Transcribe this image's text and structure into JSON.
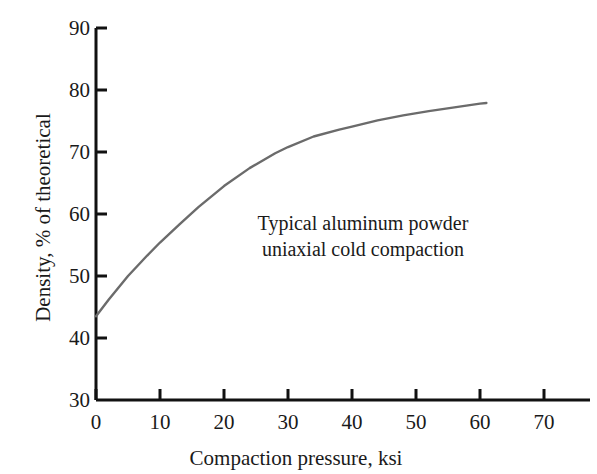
{
  "chart_data": {
    "type": "line",
    "title": "",
    "xlabel": "Compaction pressure, ksi",
    "ylabel": "Density, % of theoretical",
    "xlim": [
      0,
      74
    ],
    "ylim": [
      30,
      90
    ],
    "xticks": [
      0,
      10,
      20,
      30,
      40,
      50,
      60,
      70
    ],
    "yticks": [
      30,
      40,
      50,
      60,
      70,
      80,
      90
    ],
    "xtick_labels": [
      "0",
      "10",
      "20",
      "30",
      "40",
      "50",
      "60",
      "70"
    ],
    "ytick_labels": [
      "30",
      "40",
      "50",
      "60",
      "70",
      "80",
      "90"
    ],
    "grid": false,
    "legend": false,
    "series": [
      {
        "name": "Typical aluminum powder uniaxial cold compaction",
        "color": "#6b6b6b",
        "x": [
          0,
          2,
          5,
          8,
          10,
          13,
          16,
          20,
          24,
          28,
          30,
          34,
          38,
          40,
          44,
          48,
          52,
          56,
          60,
          61
        ],
        "y": [
          43.5,
          46.2,
          50.0,
          53.3,
          55.4,
          58.3,
          61.1,
          64.5,
          67.4,
          69.8,
          70.8,
          72.5,
          73.6,
          74.1,
          75.1,
          75.9,
          76.6,
          77.2,
          77.8,
          77.9
        ]
      }
    ],
    "annotations": [
      {
        "line1": "Typical aluminum powder",
        "line2": "uniaxial cold compaction"
      }
    ]
  },
  "axes": {
    "axis_color": "#111111",
    "tick_length": 9
  }
}
